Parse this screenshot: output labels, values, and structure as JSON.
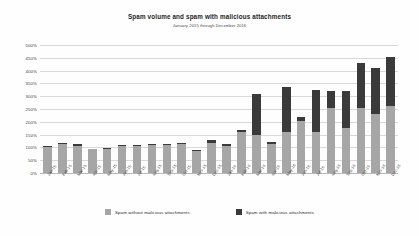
{
  "chart_data": {
    "type": "bar",
    "title": "Spam volume and spam with malicious attachments",
    "subtitle": "January 2015 through December 2016",
    "xlabel": "",
    "ylabel": "",
    "ylim": [
      0,
      500
    ],
    "ytick_labels": [
      "500%",
      "450%",
      "400%",
      "350%",
      "300%",
      "250%",
      "200%",
      "150%",
      "100%",
      "50%",
      "0%"
    ],
    "ytick_values": [
      500,
      450,
      400,
      350,
      300,
      250,
      200,
      150,
      100,
      50,
      0
    ],
    "grid": true,
    "stacked": true,
    "legend_position": "bottom",
    "categories": [
      "Jan-15",
      "Feb-15",
      "Mar-15",
      "Apr-15",
      "May-15",
      "Jun-15",
      "Jul-15",
      "Aug-15",
      "Sep-15",
      "Oct-15",
      "Nov-15",
      "Dec-15",
      "Jan-16",
      "Feb-16",
      "Mar-16",
      "Apr-16",
      "May-16",
      "Jun-16",
      "Jul-16",
      "Aug-16",
      "Sep-16",
      "Oct-16",
      "Nov-16",
      "Dec-16"
    ],
    "series": [
      {
        "name": "Spam without malicious attachments",
        "color": "#a6a6a6",
        "values": [
          100,
          112,
          107,
          92,
          95,
          104,
          105,
          108,
          110,
          112,
          85,
          118,
          106,
          160,
          150,
          115,
          160,
          205,
          160,
          255,
          175,
          255,
          232,
          262
        ]
      },
      {
        "name": "Spam with malicious attachments",
        "color": "#3a3a3a",
        "values": [
          5,
          4,
          5,
          3,
          4,
          5,
          4,
          5,
          4,
          5,
          3,
          10,
          8,
          10,
          160,
          8,
          175,
          15,
          165,
          65,
          145,
          175,
          178,
          193
        ]
      }
    ],
    "totals": [
      105,
      116,
      112,
      95,
      99,
      109,
      109,
      113,
      114,
      117,
      88,
      128,
      114,
      170,
      310,
      123,
      335,
      220,
      325,
      320,
      320,
      430,
      410,
      455
    ]
  },
  "legend": {
    "items": [
      {
        "label": "Spam without malicious attachments",
        "color": "#a6a6a6"
      },
      {
        "label": "Spam with malicious attachments",
        "color": "#3a3a3a"
      }
    ]
  }
}
